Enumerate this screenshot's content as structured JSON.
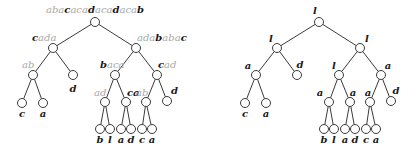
{
  "colors": {
    "edge": "#3a3a3a",
    "highlight_text": "#1a1a1a",
    "dim_text": "#a8a8a8",
    "node_fill": "#ffffff"
  },
  "trees": [
    {
      "id": "left-tree",
      "description": "Wavelet-style tree with string labels; bold letters highlighted, gray letters dimmed",
      "nodes": [
        {
          "id": "L0",
          "x": 95,
          "y": 22,
          "parent": null,
          "label": [
            {
              "t": "aba",
              "s": "g"
            },
            {
              "t": "c",
              "s": "b"
            },
            {
              "t": "aca",
              "s": "g"
            },
            {
              "t": "d",
              "s": "b"
            },
            {
              "t": "aca",
              "s": "g"
            },
            {
              "t": "d",
              "s": "b"
            },
            {
              "t": "aca",
              "s": "g"
            },
            {
              "t": "b",
              "s": "b"
            }
          ],
          "lx": 95,
          "ly": 13,
          "anchor": "middle"
        },
        {
          "id": "L1a",
          "x": 53,
          "y": 48,
          "parent": "L0",
          "label": [
            {
              "t": "c",
              "s": "b"
            },
            {
              "t": "ada",
              "s": "g"
            }
          ],
          "lx": 32,
          "ly": 41,
          "anchor": "start"
        },
        {
          "id": "L1b",
          "x": 136,
          "y": 48,
          "parent": "L0",
          "label": [
            {
              "t": "ada",
              "s": "g"
            },
            {
              "t": "b",
              "s": "b"
            },
            {
              "t": "aba",
              "s": "g"
            },
            {
              "t": "c",
              "s": "b"
            }
          ],
          "lx": 137,
          "ly": 41,
          "anchor": "start"
        },
        {
          "id": "L2a",
          "x": 33,
          "y": 75,
          "parent": "L1a",
          "label": [
            {
              "t": "ab",
              "s": "g"
            }
          ],
          "lx": 22,
          "ly": 68,
          "anchor": "start"
        },
        {
          "id": "L2b",
          "x": 73,
          "y": 75,
          "parent": "L1a",
          "label": [
            {
              "t": "d",
              "s": "b"
            }
          ],
          "lx": 73,
          "ly": 92,
          "anchor": "middle"
        },
        {
          "id": "L2c",
          "x": 115,
          "y": 75,
          "parent": "L1b",
          "label": [
            {
              "t": "b",
              "s": "b"
            },
            {
              "t": "aca",
              "s": "g"
            }
          ],
          "lx": 100,
          "ly": 68,
          "anchor": "start"
        },
        {
          "id": "L2d",
          "x": 157,
          "y": 75,
          "parent": "L1b",
          "label": [
            {
              "t": "c",
              "s": "b"
            },
            {
              "t": "ad",
              "s": "g"
            }
          ],
          "lx": 158,
          "ly": 68,
          "anchor": "start"
        },
        {
          "id": "L3a",
          "x": 22,
          "y": 103,
          "parent": "L2a",
          "label": [
            {
              "t": "c",
              "s": "b"
            }
          ],
          "lx": 22,
          "ly": 117,
          "anchor": "middle"
        },
        {
          "id": "L3b",
          "x": 43,
          "y": 103,
          "parent": "L2a",
          "label": [
            {
              "t": "a",
              "s": "b"
            }
          ],
          "lx": 43,
          "ly": 117,
          "anchor": "middle"
        },
        {
          "id": "L3c",
          "x": 105,
          "y": 102,
          "parent": "L2c",
          "label": [
            {
              "t": "ad",
              "s": "g"
            }
          ],
          "lx": 94,
          "ly": 96,
          "anchor": "start"
        },
        {
          "id": "L3d",
          "x": 126,
          "y": 102,
          "parent": "L2c",
          "label": [
            {
              "t": "ca",
              "s": "b"
            }
          ],
          "lx": 127,
          "ly": 96,
          "anchor": "start"
        },
        {
          "id": "L3e",
          "x": 146,
          "y": 102,
          "parent": "L2d",
          "label": [
            {
              "t": "ab",
              "s": "g"
            }
          ],
          "lx": 136,
          "ly": 96,
          "anchor": "start"
        },
        {
          "id": "L3f",
          "x": 167,
          "y": 101,
          "parent": "L2d",
          "label": [
            {
              "t": "d",
              "s": "b"
            }
          ],
          "lx": 171,
          "ly": 94,
          "anchor": "start"
        },
        {
          "id": "L4a",
          "x": 100,
          "y": 129,
          "parent": "L3c",
          "label": [
            {
              "t": "b",
              "s": "b"
            }
          ],
          "lx": 100,
          "ly": 143,
          "anchor": "middle"
        },
        {
          "id": "L4b",
          "x": 110,
          "y": 129,
          "parent": "L3c",
          "label": [
            {
              "t": "l",
              "s": "b"
            }
          ],
          "lx": 110,
          "ly": 143,
          "anchor": "middle"
        },
        {
          "id": "L4c",
          "x": 121,
          "y": 129,
          "parent": "L3d",
          "label": [
            {
              "t": "a",
              "s": "b"
            }
          ],
          "lx": 121,
          "ly": 143,
          "anchor": "middle"
        },
        {
          "id": "L4d",
          "x": 131,
          "y": 129,
          "parent": "L3d",
          "label": [
            {
              "t": "d",
              "s": "b"
            }
          ],
          "lx": 131,
          "ly": 143,
          "anchor": "middle"
        },
        {
          "id": "L4e",
          "x": 142,
          "y": 129,
          "parent": "L3e",
          "label": [
            {
              "t": "c",
              "s": "b"
            }
          ],
          "lx": 142,
          "ly": 143,
          "anchor": "middle"
        },
        {
          "id": "L4f",
          "x": 152,
          "y": 129,
          "parent": "L3e",
          "label": [
            {
              "t": "a",
              "s": "b"
            }
          ],
          "lx": 152,
          "ly": 143,
          "anchor": "middle"
        }
      ]
    },
    {
      "id": "right-tree",
      "description": "Same tree shape with single-character labels",
      "nodes": [
        {
          "id": "R0",
          "x": 319,
          "y": 22,
          "parent": null,
          "label": [
            {
              "t": "l",
              "s": "b"
            }
          ],
          "lx": 315,
          "ly": 14,
          "anchor": "middle"
        },
        {
          "id": "R1a",
          "x": 277,
          "y": 48,
          "parent": "R0",
          "label": [
            {
              "t": "l",
              "s": "b"
            }
          ],
          "lx": 271,
          "ly": 42,
          "anchor": "middle"
        },
        {
          "id": "R1b",
          "x": 360,
          "y": 48,
          "parent": "R0",
          "label": [
            {
              "t": "l",
              "s": "b"
            }
          ],
          "lx": 367,
          "ly": 42,
          "anchor": "middle"
        },
        {
          "id": "R2a",
          "x": 256,
          "y": 75,
          "parent": "R1a",
          "label": [
            {
              "t": "a",
              "s": "b"
            }
          ],
          "lx": 248,
          "ly": 69,
          "anchor": "middle"
        },
        {
          "id": "R2b",
          "x": 297,
          "y": 75,
          "parent": "R1a",
          "label": [
            {
              "t": "d",
              "s": "b"
            }
          ],
          "lx": 300,
          "ly": 68,
          "anchor": "middle"
        },
        {
          "id": "R2c",
          "x": 339,
          "y": 75,
          "parent": "R1b",
          "label": [
            {
              "t": "l",
              "s": "b"
            }
          ],
          "lx": 334,
          "ly": 69,
          "anchor": "middle"
        },
        {
          "id": "R2d",
          "x": 381,
          "y": 75,
          "parent": "R1b",
          "label": [
            {
              "t": "a",
              "s": "b"
            }
          ],
          "lx": 388,
          "ly": 69,
          "anchor": "middle"
        },
        {
          "id": "R3a",
          "x": 245,
          "y": 103,
          "parent": "R2a",
          "label": [
            {
              "t": "c",
              "s": "b"
            }
          ],
          "lx": 245,
          "ly": 117,
          "anchor": "middle"
        },
        {
          "id": "R3b",
          "x": 266,
          "y": 103,
          "parent": "R2a",
          "label": [
            {
              "t": "a",
              "s": "b"
            }
          ],
          "lx": 266,
          "ly": 117,
          "anchor": "middle"
        },
        {
          "id": "R3c",
          "x": 329,
          "y": 102,
          "parent": "R2c",
          "label": [
            {
              "t": "a",
              "s": "b"
            }
          ],
          "lx": 320,
          "ly": 96,
          "anchor": "middle"
        },
        {
          "id": "R3d",
          "x": 350,
          "y": 102,
          "parent": "R2c",
          "label": [
            {
              "t": "a",
              "s": "b"
            }
          ],
          "lx": 353,
          "ly": 96,
          "anchor": "middle"
        },
        {
          "id": "R3e",
          "x": 370,
          "y": 102,
          "parent": "R2d",
          "label": [
            {
              "t": "a",
              "s": "b"
            }
          ],
          "lx": 368,
          "ly": 96,
          "anchor": "middle"
        },
        {
          "id": "R3f",
          "x": 391,
          "y": 101,
          "parent": "R2d",
          "label": [
            {
              "t": "d",
              "s": "b"
            }
          ],
          "lx": 396,
          "ly": 94,
          "anchor": "middle"
        },
        {
          "id": "R4a",
          "x": 324,
          "y": 129,
          "parent": "R3c",
          "label": [
            {
              "t": "b",
              "s": "b"
            }
          ],
          "lx": 324,
          "ly": 143,
          "anchor": "middle"
        },
        {
          "id": "R4b",
          "x": 334,
          "y": 129,
          "parent": "R3c",
          "label": [
            {
              "t": "l",
              "s": "b"
            }
          ],
          "lx": 334,
          "ly": 143,
          "anchor": "middle"
        },
        {
          "id": "R4c",
          "x": 345,
          "y": 129,
          "parent": "R3d",
          "label": [
            {
              "t": "a",
              "s": "b"
            }
          ],
          "lx": 345,
          "ly": 143,
          "anchor": "middle"
        },
        {
          "id": "R4d",
          "x": 355,
          "y": 129,
          "parent": "R3d",
          "label": [
            {
              "t": "d",
              "s": "b"
            }
          ],
          "lx": 355,
          "ly": 143,
          "anchor": "middle"
        },
        {
          "id": "R4e",
          "x": 366,
          "y": 129,
          "parent": "R3e",
          "label": [
            {
              "t": "c",
              "s": "b"
            }
          ],
          "lx": 366,
          "ly": 143,
          "anchor": "middle"
        },
        {
          "id": "R4f",
          "x": 376,
          "y": 129,
          "parent": "R3e",
          "label": [
            {
              "t": "a",
              "s": "b"
            }
          ],
          "lx": 376,
          "ly": 143,
          "anchor": "middle"
        }
      ]
    }
  ]
}
